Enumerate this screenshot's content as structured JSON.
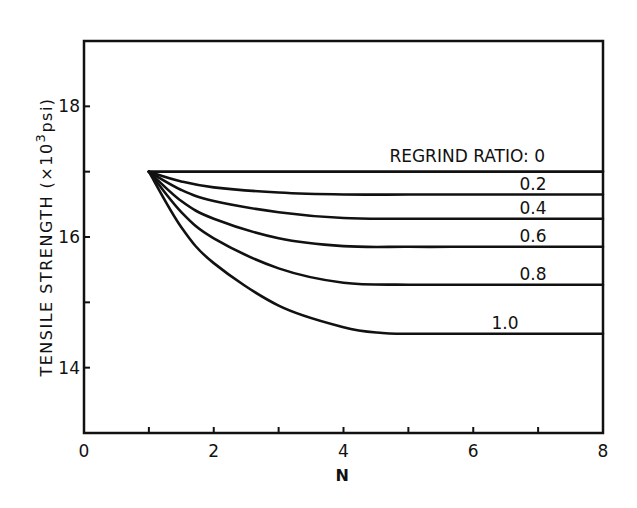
{
  "chart_data": {
    "type": "line",
    "title": "",
    "xlabel": "N",
    "ylabel": "TENSILE STRENGTH (×10³ psi)",
    "ylabel_parts": {
      "main": "TENSILE STRENGTH (×10",
      "sup": "3",
      "unit": "psi)"
    },
    "xlim": [
      0,
      8
    ],
    "ylim": [
      13,
      19
    ],
    "x_ticks": [
      0,
      2,
      4,
      6,
      8
    ],
    "x_minor_ticks": [
      1,
      3,
      5,
      7
    ],
    "y_ticks": [
      14,
      16,
      18
    ],
    "y_minor_ticks": [
      15,
      17
    ],
    "grid": false,
    "legend_title": "REGRIND RATIO:",
    "series": [
      {
        "name": "0",
        "label": "REGRIND RATIO: 0",
        "x": [
          1,
          2,
          3,
          4,
          5,
          6,
          7,
          8
        ],
        "values": [
          17.0,
          17.0,
          17.0,
          17.0,
          17.0,
          17.0,
          17.0,
          17.0
        ]
      },
      {
        "name": "0.2",
        "label": "0.2",
        "x": [
          1,
          1.5,
          2,
          3,
          4,
          5,
          6,
          7,
          8
        ],
        "values": [
          17.0,
          16.85,
          16.76,
          16.68,
          16.65,
          16.65,
          16.65,
          16.65,
          16.65
        ]
      },
      {
        "name": "0.4",
        "label": "0.4",
        "x": [
          1,
          1.5,
          2,
          3,
          4,
          5,
          6,
          7,
          8
        ],
        "values": [
          17.0,
          16.72,
          16.55,
          16.38,
          16.29,
          16.28,
          16.28,
          16.28,
          16.28
        ]
      },
      {
        "name": "0.6",
        "label": "0.6",
        "x": [
          1,
          1.5,
          2,
          3,
          4,
          5,
          6,
          7,
          8
        ],
        "values": [
          17.0,
          16.55,
          16.28,
          15.98,
          15.86,
          15.85,
          15.85,
          15.85,
          15.85
        ]
      },
      {
        "name": "0.8",
        "label": "0.8",
        "x": [
          1,
          1.5,
          2,
          3,
          4,
          5,
          6,
          7,
          8
        ],
        "values": [
          17.0,
          16.38,
          15.98,
          15.52,
          15.3,
          15.27,
          15.27,
          15.27,
          15.27
        ]
      },
      {
        "name": "1.0",
        "label": "1.0",
        "x": [
          1,
          1.5,
          2,
          3,
          4,
          4.6,
          5,
          6,
          7,
          8
        ],
        "values": [
          17.0,
          16.15,
          15.6,
          14.95,
          14.62,
          14.53,
          14.52,
          14.52,
          14.52,
          14.52
        ]
      }
    ],
    "annotations": [
      "REGRIND RATIO: 0",
      "0.2",
      "0.4",
      "0.6",
      "0.8",
      "1.0"
    ]
  },
  "layout": {
    "plot": {
      "left": 84,
      "top": 41,
      "right": 603,
      "bottom": 433
    },
    "line_color": "#111111",
    "background": "#ffffff"
  }
}
